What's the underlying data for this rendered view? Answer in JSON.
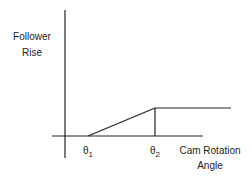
{
  "diagram": {
    "y_axis_label_line1": "Follower",
    "y_axis_label_line2": "Rise",
    "x_axis_label_line1": "Cam Rotation",
    "x_axis_label_line2": "Angle",
    "theta1": "θ",
    "theta1_sub": "1",
    "theta2": "θ",
    "theta2_sub": "2",
    "line_color": "#222222"
  }
}
